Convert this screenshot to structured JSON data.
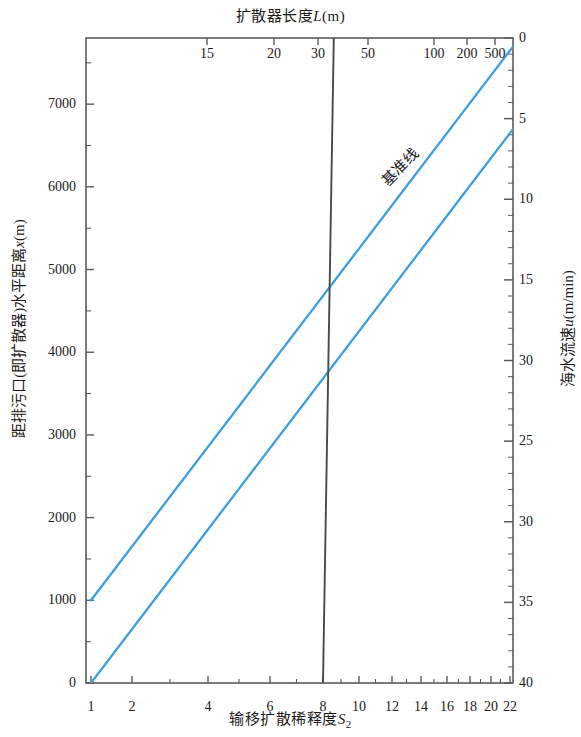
{
  "chart_data": {
    "type": "line",
    "title": "扩散器长度L(m)",
    "subtitle": "",
    "xlabel": "输移扩散稀释度S₂",
    "ylabel": "距排污口（即扩散器）水平距离x(m)",
    "xlabel_top": "扩散器长度L(m)",
    "ylabel_right": "海水流速u(m/min)",
    "grid": false,
    "legend_position": "none",
    "axes": {
      "bottom": {
        "name": "输移扩散稀释度S2",
        "scale": "nonlinear",
        "ticks": [
          1,
          2,
          4,
          6,
          8,
          10,
          12,
          14,
          16,
          18,
          20,
          22
        ],
        "tick_labels": [
          "1",
          "2",
          "4",
          "6",
          "8",
          "10",
          "12",
          "14",
          "16",
          "18",
          "20",
          "22"
        ],
        "tick_positions_px": [
          91,
          132,
          208,
          270,
          323,
          359,
          392,
          421,
          447,
          470,
          491,
          510
        ],
        "range": [
          1,
          23
        ]
      },
      "left": {
        "name": "距排污口（即扩散器）水平距离x(m)",
        "scale": "linear",
        "ticks": [
          0,
          1000,
          2000,
          3000,
          4000,
          5000,
          6000,
          7000
        ],
        "tick_labels": [
          "0",
          "1000",
          "2000",
          "3000",
          "4000",
          "5000",
          "6000",
          "7000"
        ],
        "range": [
          0,
          7800
        ],
        "units": "m"
      },
      "top": {
        "name": "扩散器长度L(m)",
        "scale": "logarithmic",
        "ticks": [
          15,
          20,
          30,
          50,
          100,
          200,
          500
        ],
        "tick_labels": [
          "15",
          "20",
          "30",
          "50",
          "100",
          "200",
          "500"
        ],
        "tick_positions_px": [
          207,
          274,
          318,
          368,
          434,
          467,
          495
        ],
        "units": "m"
      },
      "right": {
        "name": "海水流速u(m/min)",
        "scale": "linear-inverted",
        "ticks": [
          0,
          5,
          10,
          15,
          20,
          25,
          30,
          35,
          40
        ],
        "tick_labels": [
          "0",
          "5",
          "10",
          "15",
          "30",
          "25",
          "30",
          "35",
          "40"
        ],
        "range": [
          0,
          40
        ],
        "units": "m/min",
        "note_printed_label_anomaly": "30"
      }
    },
    "series": [
      {
        "name": "基准线",
        "label": "基准线",
        "color": "#3a9fe0",
        "style": "solid",
        "points": [
          [
            1,
            1000
          ],
          [
            23,
            7800
          ]
        ],
        "annotation": "基准线"
      },
      {
        "name": "line-2",
        "label": "",
        "color": "#3a9fe0",
        "style": "solid",
        "points": [
          [
            1,
            0
          ],
          [
            23,
            6800
          ]
        ]
      },
      {
        "name": "line-3",
        "label": "",
        "color": "#4a4a4a",
        "style": "solid",
        "points": [
          [
            8,
            0
          ],
          [
            8.6,
            7800
          ]
        ]
      }
    ],
    "annotations": [
      {
        "text": "基准线",
        "x_px": 398,
        "y_px": 185,
        "rotation_deg": -45
      }
    ],
    "colors": {
      "line_blue": "#3a9fe0",
      "line_dark": "#4a4a4a",
      "frame": "#5a5a5a",
      "text": "#1a1a1a",
      "background": "#ffffff"
    }
  }
}
